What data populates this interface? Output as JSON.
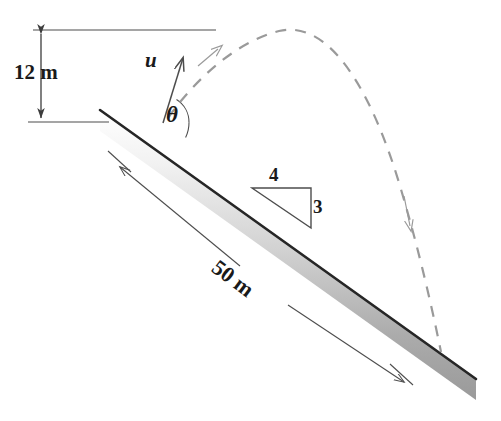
{
  "figure": {
    "labels": {
      "height": "12 m",
      "velocity": "u",
      "angle": "θ",
      "slope_rise": "3",
      "slope_run": "4",
      "incline_length": "50 m"
    },
    "colors": {
      "line": "#4d4d4d",
      "incline_edge": "#262626",
      "incline_fill_light": "#ffffff",
      "incline_fill_dark": "#9a9a9a",
      "trajectory": "#9a9a9a",
      "text": "#1a1a1a",
      "background": "#ffffff"
    },
    "geometry": {
      "incline_slope_ratio": "3:4",
      "incline_angle_deg": 36.87,
      "incline_top": [
        100,
        110
      ],
      "incline_bottom": [
        476,
        379
      ],
      "launch_point": [
        163,
        123
      ],
      "trajectory_apex": [
        277,
        30
      ],
      "trajectory_landing": [
        441,
        352
      ],
      "height_dim_top_y": 30,
      "height_dim_bottom_y": 122
    }
  }
}
